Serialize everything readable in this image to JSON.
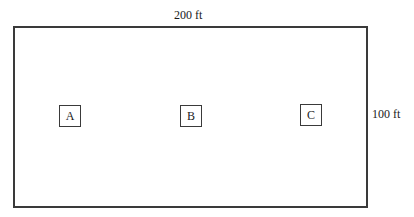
{
  "diagram": {
    "type": "rectangular lot plan",
    "outline": {
      "shape": "rectangle",
      "stroke_color": "#3a3a3a"
    },
    "dimensions": {
      "width_label": "200 ft",
      "height_label": "100 ft"
    },
    "stations": [
      {
        "label": "A",
        "position": "left"
      },
      {
        "label": "B",
        "position": "center"
      },
      {
        "label": "C",
        "position": "right"
      }
    ]
  }
}
